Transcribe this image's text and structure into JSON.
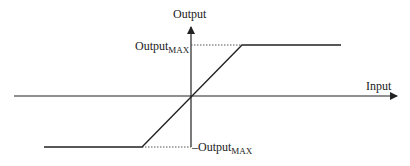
{
  "diagram": {
    "type": "saturation transfer function",
    "y_axis_label": "Output",
    "x_axis_label": "Input",
    "max_label": {
      "main": "Output",
      "sub": "MAX"
    },
    "min_label": {
      "main": "–Output",
      "sub": "MAX"
    },
    "colors": {
      "line": "#222222",
      "dotted": "#555555",
      "background": "#ffffff"
    }
  }
}
